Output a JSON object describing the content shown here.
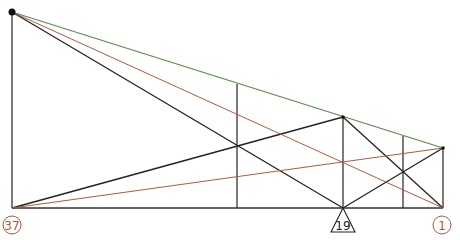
{
  "diagram": {
    "type": "truss-influence-lines",
    "colors": {
      "member": "#222222",
      "green_line": "#5a8a50",
      "red_line": "#b0593f",
      "label": "#b0593f",
      "support": "#222222"
    },
    "nodes": [
      {
        "id": "top-left"
      },
      {
        "id": "bottom-left"
      },
      {
        "id": "mid-top"
      },
      {
        "id": "right-top"
      },
      {
        "id": "bottom-right"
      },
      {
        "id": "bottom-mid"
      }
    ],
    "labels": {
      "left": "37",
      "support": "19",
      "right": "1"
    }
  }
}
